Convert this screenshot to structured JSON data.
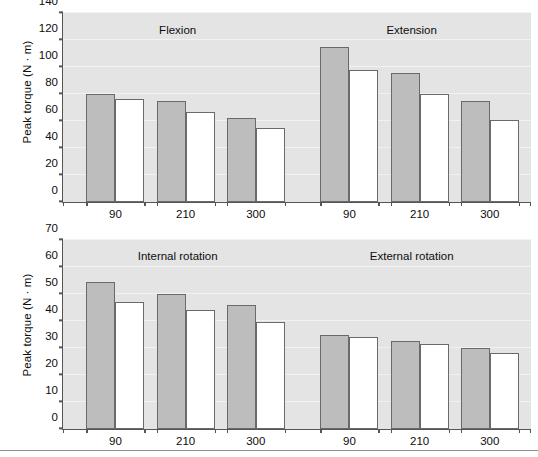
{
  "figure": {
    "width": 538,
    "height": 457,
    "bar_fill_color": "#bdbdbd",
    "bar_open_color": "#ffffff",
    "bar_edge_color": "#6a6a6a",
    "plot_background": "#e4e4e4",
    "axis_color": "#555555"
  },
  "chart_data": [
    {
      "type": "bar",
      "panel": "top",
      "title": "",
      "xlabel": "",
      "ylabel": "Peak torque (N · m)",
      "ylim": [
        0,
        140
      ],
      "yticks": [
        0,
        20,
        40,
        60,
        80,
        100,
        120,
        140
      ],
      "ytick_labels": [
        "0",
        "20",
        "40",
        "60",
        "80",
        "100",
        "120",
        "140"
      ],
      "grid": true,
      "legend": "none",
      "groups": [
        "Flexion",
        "Extension"
      ],
      "categories": [
        "90",
        "210",
        "300",
        "90",
        "210",
        "300"
      ],
      "series": [
        {
          "name": "filled",
          "values": [
            80,
            75,
            62.5,
            114.5,
            95.5,
            74.5
          ]
        },
        {
          "name": "open",
          "values": [
            76.5,
            67,
            55,
            97.5,
            80,
            60.5
          ]
        }
      ]
    },
    {
      "type": "bar",
      "panel": "bottom",
      "title": "",
      "xlabel": "",
      "ylabel": "Peak torque (N · m)",
      "ylim": [
        0,
        70
      ],
      "yticks": [
        0,
        10,
        20,
        30,
        40,
        50,
        60,
        70
      ],
      "ytick_labels": [
        "0",
        "10",
        "20",
        "30",
        "40",
        "50",
        "60",
        "70"
      ],
      "grid": true,
      "legend": "none",
      "groups": [
        "Internal rotation",
        "External rotation"
      ],
      "categories": [
        "90",
        "210",
        "300",
        "90",
        "210",
        "300"
      ],
      "series": [
        {
          "name": "filled",
          "values": [
            54.5,
            50,
            46,
            35,
            32.5,
            30
          ]
        },
        {
          "name": "open",
          "values": [
            47,
            44,
            39.5,
            34,
            31.5,
            28
          ]
        }
      ]
    }
  ],
  "panels": [
    {
      "id": "top",
      "ylabel": "Peak torque (N · m)",
      "group_labels": [
        {
          "text": "Flexion",
          "x_frac": 0.245
        },
        {
          "text": "Extension",
          "x_frac": 0.745
        }
      ]
    },
    {
      "id": "bottom",
      "ylabel": "Peak torque (N · m)",
      "group_labels": [
        {
          "text": "Internal rotation",
          "x_frac": 0.245
        },
        {
          "text": "External rotation",
          "x_frac": 0.745
        }
      ]
    }
  ],
  "bar_geometry": {
    "group_centers_frac": [
      0.112,
      0.262,
      0.412,
      0.612,
      0.762,
      0.912
    ],
    "bar_width_frac": 0.062,
    "pair_gap_frac": 0.0
  }
}
